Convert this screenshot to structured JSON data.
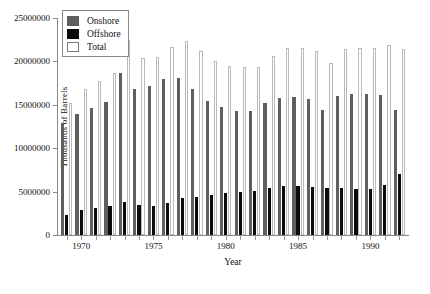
{
  "chart_data": {
    "type": "bar",
    "title": "",
    "xlabel": "Year",
    "ylabel": "Thousands of Barrels",
    "ylim": [
      0,
      25000000
    ],
    "yticks": [
      0,
      5000000,
      10000000,
      15000000,
      20000000,
      25000000
    ],
    "ytick_labels": [
      "0",
      "5000000",
      "10000000",
      "15000000",
      "20000000",
      "25000000"
    ],
    "xticks": [
      1970,
      1975,
      1980,
      1985,
      1990
    ],
    "xtick_labels": [
      "1970",
      "1975",
      "1980",
      "1985",
      "1990"
    ],
    "xlim": [
      1968.4,
      1992.6
    ],
    "grid": false,
    "legend_position": "upper-left",
    "categories": [
      1969,
      1970,
      1971,
      1972,
      1973,
      1974,
      1975,
      1976,
      1977,
      1978,
      1979,
      1980,
      1981,
      1982,
      1983,
      1984,
      1985,
      1986,
      1987,
      1988,
      1989,
      1990,
      1991,
      1992
    ],
    "series": [
      {
        "name": "Onshore",
        "color": "#5f5f5f",
        "values": [
          12900000,
          13900000,
          14600000,
          15300000,
          18700000,
          16800000,
          17200000,
          18000000,
          18100000,
          16800000,
          15400000,
          14700000,
          14300000,
          14300000,
          15200000,
          15800000,
          15900000,
          15700000,
          14400000,
          16000000,
          16200000,
          16300000,
          16100000,
          14400000
        ]
      },
      {
        "name": "Offshore",
        "color": "#0b0b0b",
        "values": [
          2300000,
          2900000,
          3100000,
          3400000,
          3800000,
          3500000,
          3300000,
          3700000,
          4300000,
          4400000,
          4600000,
          4800000,
          5000000,
          5100000,
          5400000,
          5700000,
          5600000,
          5500000,
          5400000,
          5400000,
          5300000,
          5300000,
          5800000,
          7000000
        ]
      },
      {
        "name": "Total",
        "color": "#ffffff",
        "values": [
          15200000,
          16800000,
          17700000,
          18700000,
          22500000,
          20400000,
          20500000,
          21700000,
          22400000,
          21200000,
          20000000,
          19500000,
          19300000,
          19400000,
          20600000,
          21500000,
          21500000,
          21200000,
          19800000,
          21400000,
          21500000,
          21600000,
          21900000,
          21400000
        ]
      }
    ],
    "legend": [
      {
        "label": "Onshore",
        "swatch": "gray"
      },
      {
        "label": "Offshore",
        "swatch": "black"
      },
      {
        "label": "Total",
        "swatch": "white"
      }
    ]
  }
}
